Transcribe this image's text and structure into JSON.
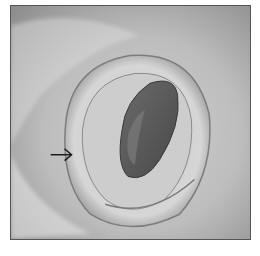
{
  "image": {
    "kind": "grayscale endoscopic photograph",
    "subject": "lumen with surrounding mucosal folds",
    "annotation": {
      "type": "arrow",
      "direction": "right",
      "color": "#1a1a1a"
    }
  },
  "colors": {
    "background": "#ffffff",
    "border": "#555555",
    "mucosa_light": "#d8d8d8",
    "mucosa_mid": "#a9a9a9",
    "lumen_dark": "#5a5a5a"
  }
}
